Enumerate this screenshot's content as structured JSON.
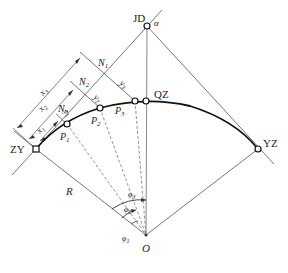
{
  "diagram": {
    "type": "circular curve layout by tangent offset method",
    "points": {
      "JD": {
        "label": "JD",
        "x": 147,
        "y": 26
      },
      "QZ": {
        "label": "QZ",
        "x": 146,
        "y": 101
      },
      "ZY": {
        "label": "ZY",
        "x": 36,
        "y": 149
      },
      "YZ": {
        "label": "YZ",
        "x": 258,
        "y": 149
      },
      "O": {
        "label": "O",
        "x": 146,
        "y": 235
      },
      "P1": {
        "label": "P",
        "sub": "1",
        "x": 67,
        "y": 124
      },
      "P2": {
        "label": "P",
        "sub": "2",
        "x": 100,
        "y": 108
      },
      "P3": {
        "label": "P",
        "sub": "3",
        "x": 135,
        "y": 101
      }
    },
    "labels": {
      "alpha": "α",
      "radius": "R",
      "N1": {
        "main": "N",
        "sub": "1"
      },
      "N2": {
        "main": "N",
        "sub": "2"
      },
      "N3": {
        "main": "N",
        "sub": "3"
      },
      "x1": {
        "main": "x",
        "sub": "1"
      },
      "x2": {
        "main": "x",
        "sub": "2"
      },
      "x3": {
        "main": "x",
        "sub": "3"
      },
      "y1": {
        "main": "y",
        "sub": "1"
      },
      "y2": {
        "main": "y",
        "sub": "2"
      },
      "y3": {
        "main": "y",
        "sub": "3"
      },
      "phi1": {
        "main": "φ",
        "sub": "1"
      },
      "phi2": {
        "main": "φ",
        "sub": "2"
      },
      "phi3": {
        "main": "φ",
        "sub": "3"
      }
    },
    "colors": {
      "line": "#555555",
      "curve": "#111111",
      "text": "#222222"
    }
  }
}
